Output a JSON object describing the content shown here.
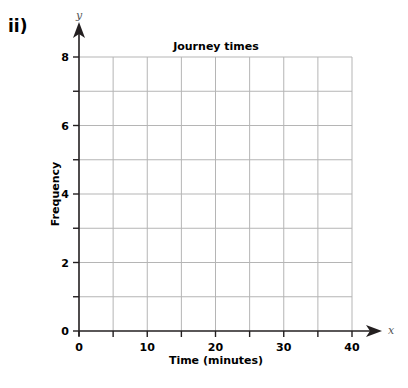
{
  "question_label": "ii)",
  "chart_data": {
    "type": "bar",
    "title": "Journey times",
    "xlabel": "Time (minutes)",
    "ylabel": "Frequency",
    "x_axis_variable": "x",
    "y_axis_variable": "y",
    "xlim": [
      0,
      40
    ],
    "ylim": [
      0,
      8
    ],
    "x_ticks": [
      0,
      10,
      20,
      30,
      40
    ],
    "x_minor_step": 5,
    "y_ticks": [
      0,
      2,
      4,
      6,
      8
    ],
    "y_minor_step": 1,
    "grid": true,
    "categories": [],
    "values": [],
    "note": "Blank grid with no data plotted"
  },
  "colors": {
    "axis": "#231f20",
    "grid": "#b5b5b5",
    "background": "#ffffff"
  }
}
